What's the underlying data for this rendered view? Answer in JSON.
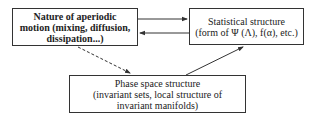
{
  "diagram": {
    "nodes": {
      "nature": {
        "lines": [
          "Nature of aperiodic",
          "motion (mixing, diffusion,",
          "dissipation...)"
        ]
      },
      "statistical": {
        "lines": [
          "Statistical structure",
          "(form of Ψ (Λ), f(α), etc.)"
        ]
      },
      "phase": {
        "lines": [
          "Phase space structure",
          "(invariant sets, local structure of",
          "invariant manifolds)"
        ]
      }
    },
    "edges": [
      {
        "from": "nature",
        "to": "statistical",
        "style": "solid"
      },
      {
        "from": "statistical",
        "to": "nature",
        "style": "solid"
      },
      {
        "from": "nature",
        "to": "phase",
        "style": "dashed"
      },
      {
        "from": "phase",
        "to": "statistical",
        "style": "solid"
      }
    ],
    "colors": {
      "line": "#333333",
      "background": "#ffffff"
    }
  }
}
